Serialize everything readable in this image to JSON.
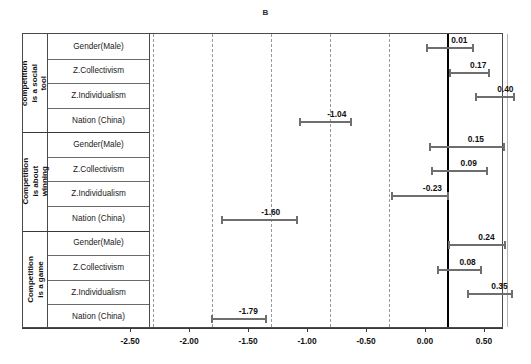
{
  "panel": {
    "title": "B"
  },
  "chart_data": {
    "type": "bar",
    "subtype": "forest-plot",
    "title": "B",
    "xlabel": "",
    "ylabel": "",
    "xlim": [
      -2.75,
      0.75
    ],
    "grid": true,
    "gridlines": [
      -2.5,
      -2.0,
      -1.5,
      -1.0,
      -0.5,
      0.0,
      0.5
    ],
    "zero_reference_line": 0.0,
    "xticks": [
      -2.5,
      -2.0,
      -1.5,
      -1.0,
      -0.5,
      0.0,
      0.5
    ],
    "xticklabels": [
      "-2.50",
      "-2.00",
      "-1.50",
      "-1.00",
      "-0.50",
      "0.00",
      "0.50"
    ],
    "legend": [],
    "groups": [
      {
        "name": "competition is a social tool",
        "rows": [
          {
            "label": "Gender(Male)",
            "estimate": 0.01,
            "estimate_label": "0.01",
            "ci_low": -0.19,
            "ci_high": 0.22
          },
          {
            "label": "Z.Collectivism",
            "estimate": 0.17,
            "estimate_label": "0.17",
            "ci_low": 0.01,
            "ci_high": 0.36
          },
          {
            "label": "Z.Individualism",
            "estimate": 0.4,
            "estimate_label": "0.40",
            "ci_low": 0.23,
            "ci_high": 0.57
          },
          {
            "label": "Nation (China)",
            "estimate": -1.04,
            "estimate_label": "-1.04",
            "ci_low": -1.26,
            "ci_high": -0.81
          }
        ]
      },
      {
        "name": "Competition is about winning",
        "rows": [
          {
            "label": "Gender(Male)",
            "estimate": 0.15,
            "estimate_label": "0.15",
            "ci_low": -0.16,
            "ci_high": 0.48
          },
          {
            "label": "Z.Collectivism",
            "estimate": 0.09,
            "estimate_label": "0.09",
            "ci_low": -0.14,
            "ci_high": 0.34
          },
          {
            "label": "Z.Individualism",
            "estimate": -0.23,
            "estimate_label": "-0.23",
            "ci_low": -0.48,
            "ci_high": 0.01
          },
          {
            "label": "Nation (China)",
            "estimate": -1.6,
            "estimate_label": "-1.60",
            "ci_low": -1.92,
            "ci_high": -1.27
          }
        ]
      },
      {
        "name": "Competition is a game",
        "rows": [
          {
            "label": "Gender(Male)",
            "estimate": 0.24,
            "estimate_label": "0.24",
            "ci_low": 0.0,
            "ci_high": 0.49
          },
          {
            "label": "Z.Collectivism",
            "estimate": 0.08,
            "estimate_label": "0.08",
            "ci_low": -0.09,
            "ci_high": 0.29
          },
          {
            "label": "Z.Individualism",
            "estimate": 0.35,
            "estimate_label": "0.35",
            "ci_low": 0.16,
            "ci_high": 0.55
          },
          {
            "label": "Nation (China)",
            "estimate": -1.79,
            "estimate_label": "-1.79",
            "ci_low": -2.01,
            "ci_high": -1.53
          }
        ]
      }
    ]
  },
  "style": {
    "bar_color": "#6e6e6e",
    "zero_line_color": "#000000",
    "grid_color": "#9a9a9a",
    "frame_color": "#4a4a4a",
    "text_color": "#111111"
  }
}
